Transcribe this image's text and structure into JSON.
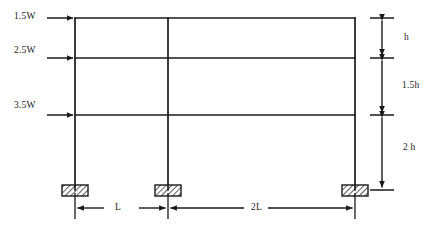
{
  "figure": {
    "kind": "structural-frame-elevation",
    "stroke_color": "#1a1a1a",
    "background_color": "#ffffff"
  },
  "loads": [
    {
      "id": "load-top",
      "label": "1.5W",
      "level_y": 18,
      "label_x": 14,
      "label_y": 10,
      "arrow_x_start": 47,
      "arrow_x_end": 75
    },
    {
      "id": "load-middle",
      "label": "2.5W",
      "level_y": 58,
      "label_x": 14,
      "label_y": 44,
      "arrow_x_start": 47,
      "arrow_x_end": 75
    },
    {
      "id": "load-lower",
      "label": "3.5W",
      "level_y": 115,
      "label_x": 14,
      "label_y": 99,
      "arrow_x_start": 47,
      "arrow_x_end": 75
    }
  ],
  "vertical_dimensions": [
    {
      "id": "dim-h",
      "label": "h",
      "y_top": 18,
      "y_bottom": 57,
      "label_x": 404,
      "label_y": 34
    },
    {
      "id": "dim-1-5h",
      "label": "1.5h",
      "y_top": 60,
      "y_bottom": 113,
      "label_x": 404,
      "label_y": 82
    },
    {
      "id": "dim-2h",
      "label": "2 h",
      "y_top": 117,
      "y_bottom": 190,
      "label_x": 404,
      "label_y": 144
    }
  ],
  "horizontal_dimensions": [
    {
      "id": "dim-L",
      "label": "L",
      "x_left": 75,
      "x_right": 167,
      "label_x": 115,
      "label_y": 205
    },
    {
      "id": "dim-2L",
      "label": "2L",
      "x_left": 170,
      "x_right": 355,
      "label_x": 255,
      "label_y": 205
    }
  ],
  "columns": [
    {
      "id": "column-left",
      "x": 75,
      "y_top": 18,
      "y_bottom": 190
    },
    {
      "id": "column-middle",
      "x": 168,
      "y_top": 18,
      "y_bottom": 190
    },
    {
      "id": "column-right",
      "x": 355,
      "y_top": 18,
      "y_bottom": 190
    }
  ],
  "beams": [
    {
      "id": "beam-top",
      "y": 18,
      "x_left": 75,
      "x_right": 355
    },
    {
      "id": "beam-middle",
      "y": 58,
      "x_left": 75,
      "x_right": 355
    },
    {
      "id": "beam-lower",
      "y": 115,
      "x_left": 75,
      "x_right": 355
    }
  ],
  "supports": [
    {
      "id": "support-left",
      "cx": 75,
      "cy": 190
    },
    {
      "id": "support-middle",
      "cx": 168,
      "cy": 190
    },
    {
      "id": "support-right",
      "cx": 355,
      "cy": 190
    }
  ]
}
